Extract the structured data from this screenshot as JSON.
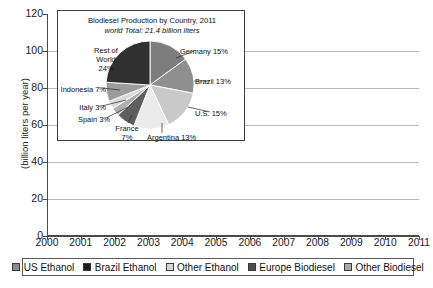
{
  "chart_data": {
    "type": "area",
    "stacked": true,
    "title": "",
    "xlabel": "",
    "ylabel": "(billion liters per year)",
    "ylim": [
      0,
      120
    ],
    "ytick_step": 20,
    "yticks": [
      "0",
      "20",
      "40",
      "60",
      "80",
      "100",
      "120"
    ],
    "grid": true,
    "legend_position": "bottom",
    "categories": [
      "2000",
      "2001",
      "2002",
      "2003",
      "2004",
      "2005",
      "2006",
      "2007",
      "2008",
      "2009",
      "2010",
      "2011"
    ],
    "series": [
      {
        "name": "US Ethanol",
        "color": "#8a8a8a",
        "values": [
          6,
          7,
          8,
          11,
          13,
          15,
          18,
          25,
          34,
          41,
          50,
          54
        ]
      },
      {
        "name": "Brazil Ethanol",
        "color": "#1c1c1c",
        "values": [
          10,
          11,
          12,
          14,
          15,
          16,
          17,
          22,
          27,
          26,
          28,
          21
        ]
      },
      {
        "name": "Other Ethanol",
        "color": "#d6d6d6",
        "values": [
          1,
          1,
          1,
          2,
          2,
          3,
          4,
          5,
          7,
          8,
          10,
          11
        ]
      },
      {
        "name": "Europe Biodiesel",
        "color": "#4d4d4d",
        "values": [
          1,
          1,
          2,
          2,
          3,
          4,
          6,
          8,
          10,
          11,
          12,
          11
        ]
      },
      {
        "name": "Other Biodiesel",
        "color": "#a8a8a8",
        "values": [
          0,
          0,
          0,
          1,
          1,
          1,
          2,
          3,
          5,
          6,
          7,
          6
        ]
      }
    ],
    "totals": [
      18,
      20,
      23,
      30,
      34,
      39,
      47,
      63,
      83,
      92,
      107,
      103
    ]
  },
  "legend": {
    "items": [
      {
        "label": "US Ethanol",
        "color": "#8a8a8a"
      },
      {
        "label": "Brazil Ethanol",
        "color": "#1c1c1c"
      },
      {
        "label": "Other Ethanol",
        "color": "#d6d6d6"
      },
      {
        "label": "Europe Biodiesel",
        "color": "#4d4d4d"
      },
      {
        "label": "Other Biodiesel",
        "color": "#a8a8a8"
      }
    ]
  },
  "inset": {
    "title_line1": "Biodiesel Production by Country, 2011",
    "title_line2": "world Total: 21.4 billion liters",
    "pie": {
      "type": "pie",
      "slices": [
        {
          "label": "Germany 15%",
          "name": "Germany",
          "value": 15,
          "color": "#7d7d7d"
        },
        {
          "label": "Brazil 13%",
          "name": "Brazil",
          "value": 13,
          "color": "#8f8f8f"
        },
        {
          "label": "U.S. 15%",
          "name": "U.S.",
          "value": 15,
          "color": "#c9c9c9"
        },
        {
          "label": "Argentina 13%",
          "name": "Argentina",
          "value": 13,
          "color": "#ebebeb"
        },
        {
          "label": "France 7%",
          "name": "France",
          "value": 7,
          "color": "#5e5e5e"
        },
        {
          "label": "Spain 3%",
          "name": "Spain",
          "value": 3,
          "color": "#aeaeae"
        },
        {
          "label": "Italy 3%",
          "name": "Italy",
          "value": 3,
          "color": "#d9d9d9"
        },
        {
          "label": "Indonesia 7%",
          "name": "Indonesia",
          "value": 7,
          "color": "#9c9c9c"
        },
        {
          "label": "Rest of World 24%",
          "name": "Rest of World",
          "value": 24,
          "color": "#303030"
        }
      ]
    },
    "labels": {
      "germany": "Germany 15%",
      "brazil": "Brazil 13%",
      "us": "U.S. 15%",
      "argentina": "Argentina 13%",
      "france_l1": "France",
      "france_l2": "7%",
      "spain": "Spain 3%",
      "italy": "Italy 3%",
      "indonesia": "Indonesia 7%",
      "row_l1": "Rest of",
      "row_l2": "World",
      "row_l3": "24%"
    }
  }
}
